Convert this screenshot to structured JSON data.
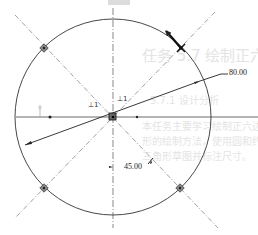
{
  "diagram": {
    "type": "cad-sketch",
    "center": {
      "x": 113,
      "y": 117
    },
    "radius": 98,
    "dimensions": {
      "radius_label": "80.00",
      "angle_label": "45.00"
    },
    "constraint_symbols": [
      {
        "label": "⊥1",
        "x": 85,
        "y": 104
      },
      {
        "label": "⊥1",
        "x": 116,
        "y": 99
      }
    ],
    "markers": [
      {
        "name": "upper-left",
        "x": 44,
        "y": 48
      },
      {
        "name": "upper-right",
        "x": 181,
        "y": 48
      },
      {
        "name": "lower-left",
        "x": 44,
        "y": 188
      },
      {
        "name": "lower-right",
        "x": 180,
        "y": 188
      }
    ],
    "colors": {
      "line": "#333333",
      "construction": "#777777",
      "background": "#ffffff"
    }
  },
  "ghost_text": {
    "heading": "任务 5.7  绘制正六边形",
    "subheading": "5.7.1  设计分析",
    "line1": "本任务主要学习绘制正六边形，正六边",
    "line2": "形的绘制方法，使用圆和约束绘制",
    "line3": "三角形草图并标注尺寸。"
  }
}
